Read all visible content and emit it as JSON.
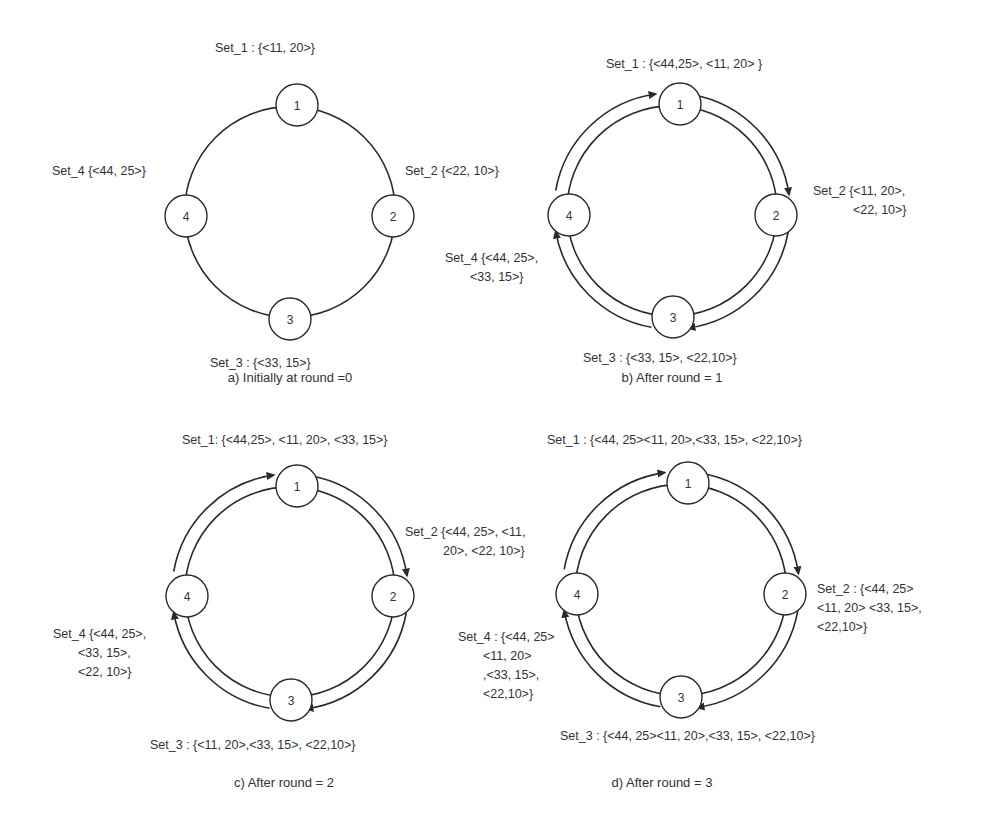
{
  "figure": {
    "panels": [
      {
        "id": "a",
        "caption": "a)   Initially  at round =0",
        "caption_pos": [
          290,
          382
        ],
        "center": [
          290,
          212
        ],
        "nodes": [
          {
            "id": "1",
            "label": "1",
            "pos": [
              297,
              105
            ]
          },
          {
            "id": "2",
            "label": "2",
            "pos": [
              393,
              216
            ]
          },
          {
            "id": "3",
            "label": "3",
            "pos": [
              290,
              319
            ]
          },
          {
            "id": "4",
            "label": "4",
            "pos": [
              186,
              216
            ]
          }
        ],
        "arrows": false,
        "sets": [
          {
            "name": "Set_1",
            "lines": [
              "Set_1 : {<11, 20>}"
            ],
            "pos": [
              215,
              52
            ],
            "anchor": "start"
          },
          {
            "name": "Set_2",
            "lines": [
              "Set_2 {<22, 10>}"
            ],
            "pos": [
              405,
              175
            ],
            "anchor": "start"
          },
          {
            "name": "Set_3",
            "lines": [
              "Set_3 : {<33, 15>}"
            ],
            "pos": [
              210,
              367
            ],
            "anchor": "start"
          },
          {
            "name": "Set_4",
            "lines": [
              "Set_4 {<44, 25>}"
            ],
            "pos": [
              52,
              175
            ],
            "anchor": "start"
          }
        ]
      },
      {
        "id": "b",
        "caption": "b)   After  round = 1",
        "caption_pos": [
          672,
          382
        ],
        "center": [
          672,
          211
        ],
        "nodes": [
          {
            "id": "1",
            "label": "1",
            "pos": [
              680,
              104
            ]
          },
          {
            "id": "2",
            "label": "2",
            "pos": [
              776,
              215
            ]
          },
          {
            "id": "3",
            "label": "3",
            "pos": [
              673,
              317
            ]
          },
          {
            "id": "4",
            "label": "4",
            "pos": [
              569,
              215
            ]
          }
        ],
        "arrows": true,
        "sets": [
          {
            "name": "Set_1",
            "lines": [
              "Set_1 : {<44,25>, <11, 20> }"
            ],
            "pos": [
              606,
              68
            ],
            "anchor": "start"
          },
          {
            "name": "Set_2",
            "lines": [
              "Set_2 {<11, 20>,",
              "<22, 10>}"
            ],
            "pos": [
              813,
              195
            ],
            "anchor": "start",
            "indent": 40
          },
          {
            "name": "Set_3",
            "lines": [
              "Set_3 : {<33, 15>, <22,10>}"
            ],
            "pos": [
              583,
              362
            ],
            "anchor": "start"
          },
          {
            "name": "Set_4",
            "lines": [
              "Set_4 {<44, 25>,",
              "<33, 15>}"
            ],
            "pos": [
              445,
              262
            ],
            "anchor": "start",
            "indent": 25
          }
        ]
      },
      {
        "id": "c",
        "caption": "c)   After  round = 2",
        "caption_pos": [
          284,
          787
        ],
        "center": [
          290,
          592
        ],
        "nodes": [
          {
            "id": "1",
            "label": "1",
            "pos": [
              297,
              486
            ]
          },
          {
            "id": "2",
            "label": "2",
            "pos": [
              393,
              596
            ]
          },
          {
            "id": "3",
            "label": "3",
            "pos": [
              291,
              700
            ]
          },
          {
            "id": "4",
            "label": "4",
            "pos": [
              187,
              596
            ]
          }
        ],
        "arrows": true,
        "sets": [
          {
            "name": "Set_1",
            "lines": [
              "Set_1: {<44,25>, <11, 20>, <33, 15>}"
            ],
            "pos": [
              182,
              444
            ],
            "anchor": "start"
          },
          {
            "name": "Set_2",
            "lines": [
              "Set_2 {<44, 25>, <11,",
              "20>, <22, 10>}"
            ],
            "pos": [
              405,
              536
            ],
            "anchor": "start",
            "indent": 38
          },
          {
            "name": "Set_3",
            "lines": [
              "Set_3 : {<11, 20>,<33, 15>, <22,10>}"
            ],
            "pos": [
              150,
              749
            ],
            "anchor": "start"
          },
          {
            "name": "Set_4",
            "lines": [
              "Set_4 {<44, 25>,",
              "<33, 15>,",
              "<22, 10>}"
            ],
            "pos": [
              53,
              638
            ],
            "anchor": "start",
            "indent": 25
          }
        ]
      },
      {
        "id": "d",
        "caption": "d)   After  round = 3",
        "caption_pos": [
          662,
          787
        ],
        "center": [
          681,
          590
        ],
        "nodes": [
          {
            "id": "1",
            "label": "1",
            "pos": [
              688,
              483
            ]
          },
          {
            "id": "2",
            "label": "2",
            "pos": [
              785,
              594
            ]
          },
          {
            "id": "3",
            "label": "3",
            "pos": [
              681,
              697
            ]
          },
          {
            "id": "4",
            "label": "4",
            "pos": [
              577,
              594
            ]
          }
        ],
        "arrows": true,
        "sets": [
          {
            "name": "Set_1",
            "lines": [
              "Set_1 : {<44, 25><11, 20>,<33, 15>, <22,10>}"
            ],
            "pos": [
              547,
              444
            ],
            "anchor": "start"
          },
          {
            "name": "Set_2",
            "lines": [
              "Set_2 : {<44, 25>",
              "<11, 20> <33, 15>,",
              "<22,10>}"
            ],
            "pos": [
              817,
              593
            ],
            "anchor": "start",
            "indent": 0
          },
          {
            "name": "Set_3",
            "lines": [
              "Set_3 : {<44, 25><11, 20>,<33, 15>, <22,10>}"
            ],
            "pos": [
              560,
              740
            ],
            "anchor": "start"
          },
          {
            "name": "Set_4",
            "lines": [
              "Set_4 : {<44, 25>",
              "<11, 20>",
              ",<33, 15>,",
              "<22,10>}"
            ],
            "pos": [
              458,
              641
            ],
            "anchor": "start",
            "indent": 25
          }
        ]
      }
    ]
  },
  "style": {
    "stroke": "#2a2a2a",
    "text": "#333333",
    "background": "#ffffff",
    "node_radius": 21,
    "line_height": 19
  }
}
